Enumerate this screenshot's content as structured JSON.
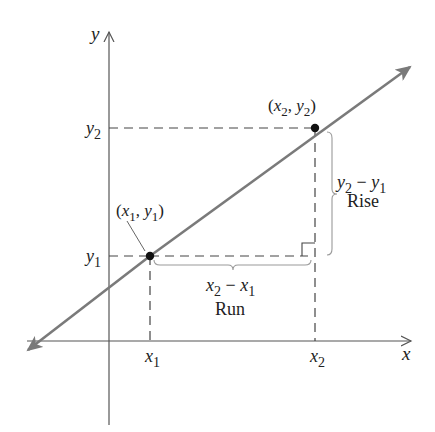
{
  "diagram": {
    "type": "slope-of-line",
    "colors": {
      "line": "#7a7a7a",
      "axis": "#555555",
      "dash": "#444444",
      "brace": "#9a9a9a",
      "point": "#111111",
      "text": "#222222"
    },
    "axes": {
      "x_label": "x",
      "y_label": "y"
    },
    "ticks": {
      "x1": {
        "base": "x",
        "sub": "1"
      },
      "x2": {
        "base": "x",
        "sub": "2"
      },
      "y1": {
        "base": "y",
        "sub": "1"
      },
      "y2": {
        "base": "y",
        "sub": "2"
      }
    },
    "points": [
      {
        "id": "p1",
        "label_open": "(",
        "xb": "x",
        "xs": "1",
        "sep": ", ",
        "yb": "y",
        "ys": "1",
        "label_close": ")"
      },
      {
        "id": "p2",
        "label_open": "(",
        "xb": "x",
        "xs": "2",
        "sep": ", ",
        "yb": "y",
        "ys": "2",
        "label_close": ")"
      }
    ],
    "rise": {
      "expr": {
        "a": "y",
        "as": "2",
        "op": " − ",
        "b": "y",
        "bs": "1"
      },
      "label": "Rise"
    },
    "run": {
      "expr": {
        "a": "x",
        "as": "2",
        "op": " − ",
        "b": "x",
        "bs": "1"
      },
      "label": "Run"
    }
  }
}
